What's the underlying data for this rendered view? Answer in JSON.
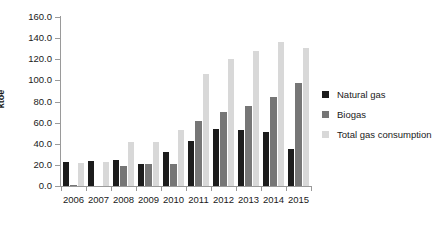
{
  "chart_data": {
    "type": "bar",
    "title": "",
    "xlabel": "",
    "ylabel": "ktoe",
    "ylim": [
      0,
      160
    ],
    "ytick_step": 20,
    "ytick_labels": [
      "0.0",
      "20.0",
      "40.0",
      "60.0",
      "80.0",
      "100.0",
      "120.0",
      "140.0",
      "160.0"
    ],
    "ytick_values": [
      0,
      20,
      40,
      60,
      80,
      100,
      120,
      140,
      160
    ],
    "grid": false,
    "legend_position": "right",
    "categories": [
      "2006",
      "2007",
      "2008",
      "2009",
      "2010",
      "2011",
      "2012",
      "2013",
      "2014",
      "2015"
    ],
    "series": [
      {
        "name": "Natural gas",
        "color": "#1c1c1c",
        "values": [
          23,
          24,
          25,
          21,
          32,
          43,
          54,
          53,
          51,
          35
        ]
      },
      {
        "name": "Biogas",
        "color": "#767676",
        "values": [
          1,
          0,
          19,
          21,
          21,
          62,
          70,
          76,
          84,
          98
        ]
      },
      {
        "name": "Total gas consumption",
        "color": "#d8d8d8",
        "values": [
          22,
          23,
          42,
          42,
          53,
          106,
          120,
          128,
          136,
          131
        ]
      }
    ]
  },
  "colors": {
    "natural_gas": "#1c1c1c",
    "biogas": "#767676",
    "total_gas_consumption": "#d8d8d8",
    "axis": "#9a9a9a",
    "text": "#1a1a1a",
    "background": "#ffffff"
  }
}
